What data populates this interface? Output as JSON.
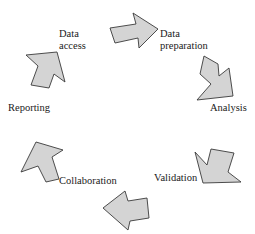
{
  "diagram": {
    "type": "cycle",
    "arrow_fill": "#d4d4d4",
    "arrow_stroke": "#3a3a3a",
    "stages": [
      {
        "id": "data-access",
        "line1": "Data",
        "line2": "access"
      },
      {
        "id": "data-preparation",
        "line1": "Data",
        "line2": "preparation"
      },
      {
        "id": "analysis",
        "line1": "Analysis"
      },
      {
        "id": "validation",
        "line1": "Validation"
      },
      {
        "id": "collaboration",
        "line1": "Collaboration"
      },
      {
        "id": "reporting",
        "line1": "Reporting"
      }
    ]
  }
}
